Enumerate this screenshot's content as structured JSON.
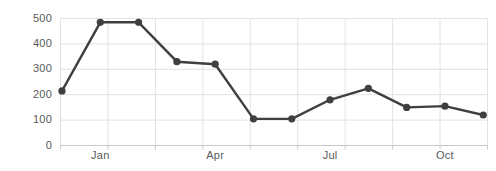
{
  "chart_data": {
    "type": "line",
    "title": "",
    "xlabel": "",
    "ylabel": "",
    "ylim": [
      0,
      500
    ],
    "grid": true,
    "legend": "none",
    "marker": "circle",
    "line_color": "#3f3f3f",
    "marker_color": "#3f3f3f",
    "grid_color": "#e2e2e2",
    "axis_color": "#c9c9c9",
    "tick_label_color": "#58595b",
    "background_color": "#ffffff",
    "y_ticks": [
      0,
      100,
      200,
      300,
      400,
      500
    ],
    "y_tick_labels": [
      "0",
      "100",
      "200",
      "300",
      "400",
      "500"
    ],
    "x_tick_labels": [
      "Jan",
      "Apr",
      "Jul",
      "Oct"
    ],
    "x_tick_indices": [
      1,
      4,
      7,
      10
    ],
    "categories": [
      "Dec",
      "Jan",
      "Feb",
      "Mar",
      "Apr",
      "May",
      "Jun",
      "Jul",
      "Aug",
      "Sep",
      "Oct",
      "Nov"
    ],
    "values": [
      215,
      485,
      485,
      330,
      320,
      105,
      105,
      180,
      225,
      150,
      155,
      120
    ]
  }
}
